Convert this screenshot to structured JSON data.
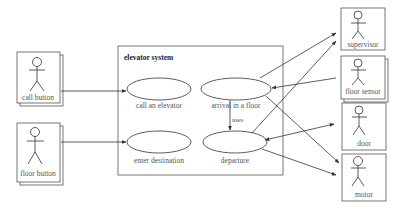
{
  "diagram": {
    "type": "use-case",
    "system": {
      "title": "elevator system"
    },
    "use_cases": [
      {
        "id": "uc1",
        "label": "call an elevator"
      },
      {
        "id": "uc2",
        "label": "arrival in a floor"
      },
      {
        "id": "uc3",
        "label": "enter destination"
      },
      {
        "id": "uc4",
        "label": "departure"
      }
    ],
    "actors": [
      {
        "id": "a1",
        "label": "call button"
      },
      {
        "id": "a2",
        "label": "floor button"
      },
      {
        "id": "a3",
        "label": "supervisor"
      },
      {
        "id": "a4",
        "label": "floor sensor"
      },
      {
        "id": "a5",
        "label": "door"
      },
      {
        "id": "a6",
        "label": "motor"
      }
    ],
    "relations": [
      {
        "from": "call button",
        "to": "call an elevator",
        "type": "association-arrow"
      },
      {
        "from": "floor button",
        "to": "enter destination",
        "type": "association-arrow"
      },
      {
        "from": "arrival in a floor",
        "to": "departure",
        "type": "uses",
        "label": "uses"
      },
      {
        "from": "arrival in a floor",
        "to": "supervisor",
        "type": "association-arrow"
      },
      {
        "from": "floor sensor",
        "to": "arrival in a floor",
        "type": "association-arrow"
      },
      {
        "from": "arrival in a floor",
        "to": "motor",
        "type": "association-arrow"
      },
      {
        "from": "departure",
        "to": "supervisor",
        "type": "association-arrow"
      },
      {
        "from": "departure",
        "to": "door",
        "type": "bidirectional-arrow"
      },
      {
        "from": "departure",
        "to": "motor",
        "type": "association-arrow"
      }
    ],
    "uses_label": "uses"
  }
}
